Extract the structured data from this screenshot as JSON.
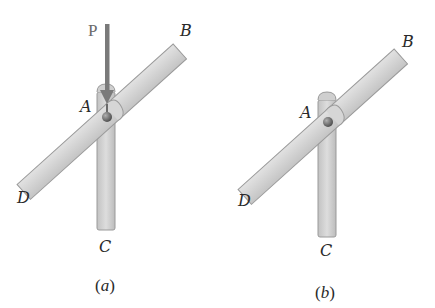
{
  "figure": {
    "panels": [
      {
        "id": "a",
        "caption": "(a)",
        "caption_letter": "a",
        "labels": {
          "top_end": "B",
          "pin": "A",
          "bottom_left_end": "D",
          "bottom_end": "C",
          "force": "P"
        },
        "has_force": true
      },
      {
        "id": "b",
        "caption": "(b)",
        "caption_letter": "b",
        "labels": {
          "top_end": "B",
          "pin": "A",
          "bottom_left_end": "D",
          "bottom_end": "C"
        },
        "has_force": false
      }
    ],
    "colors": {
      "bar_fill": "#d4d4d4",
      "bar_edge": "#9a9a9a",
      "force_arrow": "#7a7a7a",
      "pin": "#6e6e6e",
      "text": "#2a2a2a"
    }
  }
}
